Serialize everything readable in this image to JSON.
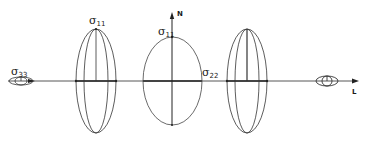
{
  "diagram": {
    "axes": {
      "horizontal": {
        "label": "L"
      },
      "vertical": {
        "label": "N"
      }
    },
    "labels": {
      "sigma_33": {
        "symbol": "σ",
        "subscript": "33"
      },
      "sigma_11_left": {
        "symbol": "σ",
        "subscript": "11"
      },
      "sigma_11_center": {
        "symbol": "σ",
        "subscript": "11"
      },
      "sigma_22": {
        "symbol": "σ",
        "subscript": "22"
      }
    },
    "shapes": [
      {
        "name": "small-ellipsoid-left",
        "type": "ellipsoid"
      },
      {
        "name": "tall-ellipsoid-left",
        "type": "ellipsoid"
      },
      {
        "name": "center-ellipse",
        "type": "ellipse"
      },
      {
        "name": "tall-ellipsoid-right",
        "type": "ellipsoid"
      },
      {
        "name": "small-ellipsoid-right",
        "type": "ellipsoid"
      }
    ],
    "colors": {
      "line": "#2a2a2a",
      "background": "#ffffff"
    }
  }
}
